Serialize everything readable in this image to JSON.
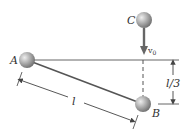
{
  "diagram": {
    "points": {
      "A": {
        "label": "A",
        "x": 27,
        "y": 60
      },
      "B": {
        "label": "B",
        "x": 143,
        "y": 104
      },
      "C": {
        "label": "C",
        "x": 144,
        "y": 20
      }
    },
    "velocity_label": "v",
    "velocity_subscript": "0",
    "dimension_rod_label": "l",
    "dimension_drop_label": "l/3",
    "colors": {
      "ball": "#9a9a9a",
      "ball_highlight": "#e6e6e6",
      "line": "#555555",
      "arrow": "#666666",
      "text": "#333333"
    }
  }
}
